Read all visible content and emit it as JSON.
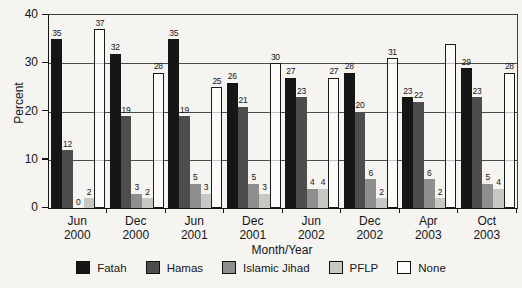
{
  "chart_data": {
    "type": "bar",
    "title": "",
    "xlabel": "Month/Year",
    "ylabel": "Percent",
    "ylim": [
      0,
      40
    ],
    "yticks": [
      0,
      10,
      20,
      30,
      40
    ],
    "grid": true,
    "legend_position": "bottom",
    "categories": [
      {
        "month": "Jun",
        "year": "2000"
      },
      {
        "month": "Dec",
        "year": "2000"
      },
      {
        "month": "Jun",
        "year": "2001"
      },
      {
        "month": "Dec",
        "year": "2001"
      },
      {
        "month": "Jun",
        "year": "2002"
      },
      {
        "month": "Dec",
        "year": "2002"
      },
      {
        "month": "Apr",
        "year": "2003"
      },
      {
        "month": "Oct",
        "year": "2003"
      }
    ],
    "series": [
      {
        "name": "Fatah",
        "color": "#161616",
        "outlined": false,
        "values": [
          35,
          32,
          35,
          26,
          27,
          28,
          23,
          29
        ],
        "labels": [
          "35",
          "32",
          "35",
          "26",
          "27",
          "28",
          "23",
          "29"
        ]
      },
      {
        "name": "Hamas",
        "color": "#4d4d4d",
        "outlined": false,
        "values": [
          12,
          19,
          19,
          21,
          23,
          20,
          22,
          23
        ],
        "labels": [
          "12",
          "19",
          "19",
          "21",
          "23",
          "20",
          "22",
          "23"
        ]
      },
      {
        "name": "Islamic Jihad",
        "color": "#8e8e8e",
        "outlined": false,
        "values": [
          0,
          3,
          5,
          5,
          4,
          6,
          6,
          5
        ],
        "labels": [
          "0",
          "3",
          "5",
          "5",
          "4",
          "6",
          "6",
          "5"
        ]
      },
      {
        "name": "PFLP",
        "color": "#c7c7c4",
        "outlined": false,
        "values": [
          2,
          2,
          3,
          3,
          4,
          2,
          2,
          4
        ],
        "labels": [
          "2",
          "2",
          "3",
          "3",
          "4",
          "2",
          "2",
          "4"
        ]
      },
      {
        "name": "None",
        "color": "#fdfdfc",
        "outlined": true,
        "values": [
          37,
          28,
          25,
          30,
          27,
          31,
          34,
          28
        ],
        "labels": [
          "37",
          "28",
          "25",
          "30",
          "27",
          "31",
          "",
          "28"
        ]
      }
    ]
  }
}
